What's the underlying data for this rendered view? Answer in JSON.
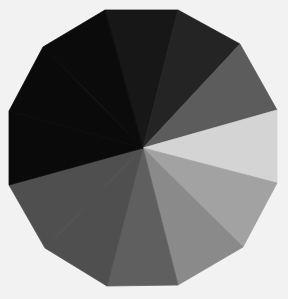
{
  "figure": {
    "width": 288,
    "height": 299,
    "background": "#f2f2f2",
    "center": [
      143,
      148
    ],
    "shape": "polygon divided into triangular wedges from center",
    "wedges": [
      {
        "name": "wedge-top",
        "from": [
          105,
          10
        ],
        "to": [
          178,
          10
        ],
        "color": "#171717"
      },
      {
        "name": "wedge-top-right",
        "from": [
          178,
          10
        ],
        "to": [
          240,
          44
        ],
        "color": "#242424"
      },
      {
        "name": "wedge-right-upper",
        "from": [
          240,
          44
        ],
        "to": [
          277,
          110
        ],
        "color": "#5c5c5c"
      },
      {
        "name": "wedge-right",
        "from": [
          277,
          110
        ],
        "to": [
          277,
          183
        ],
        "color": "#d4d4d4"
      },
      {
        "name": "wedge-right-lower",
        "from": [
          277,
          183
        ],
        "to": [
          243,
          247
        ],
        "color": "#a2a2a2"
      },
      {
        "name": "wedge-bottom-right",
        "from": [
          243,
          247
        ],
        "to": [
          178,
          285
        ],
        "color": "#8a8a8a"
      },
      {
        "name": "wedge-bottom",
        "from": [
          178,
          285
        ],
        "to": [
          107,
          286
        ],
        "color": "#5f5f5f"
      },
      {
        "name": "wedge-bottom-left",
        "from": [
          107,
          286
        ],
        "to": [
          45,
          248
        ],
        "via": [],
        "color": "#4f4f4f"
      },
      {
        "name": "wedge-left-lower",
        "from": [
          45,
          248
        ],
        "to": [
          9,
          185
        ],
        "color": "#4f4f4f"
      },
      {
        "name": "wedge-left",
        "from": [
          9,
          185
        ],
        "to": [
          9,
          111
        ],
        "color": "#0a0a0a"
      },
      {
        "name": "wedge-upper-left",
        "from": [
          9,
          111
        ],
        "to": [
          43,
          47
        ],
        "color": "#0a0a0a"
      },
      {
        "name": "wedge-upper-left-top",
        "from": [
          43,
          47
        ],
        "to": [
          105,
          10
        ],
        "color": "#0b0b0b"
      }
    ]
  }
}
